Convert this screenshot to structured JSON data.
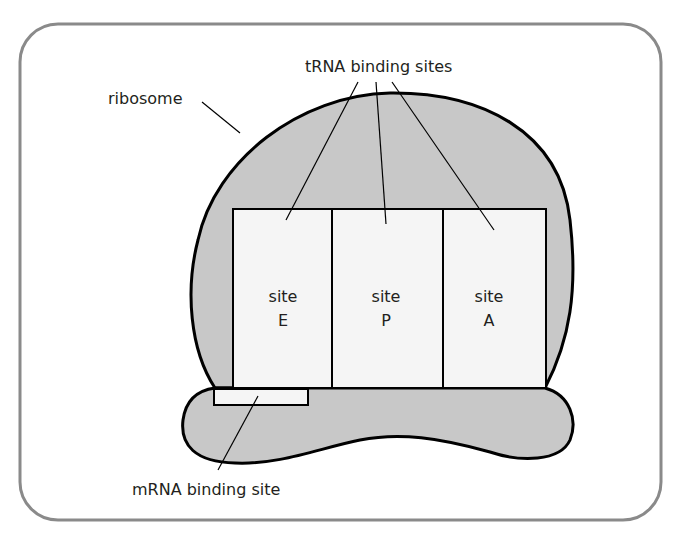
{
  "diagram": {
    "labels": {
      "ribosome": "ribosome",
      "trna_sites": "tRNA binding sites",
      "mrna_site": "mRNA binding site"
    },
    "sites": [
      {
        "line1": "site",
        "line2": "E"
      },
      {
        "line1": "site",
        "line2": "P"
      },
      {
        "line1": "site",
        "line2": "A"
      }
    ],
    "colors": {
      "frame_border": "#8a8a8a",
      "ribosome_fill": "#c8c8c8",
      "site_fill": "#f5f5f5",
      "outline": "#000000"
    }
  }
}
